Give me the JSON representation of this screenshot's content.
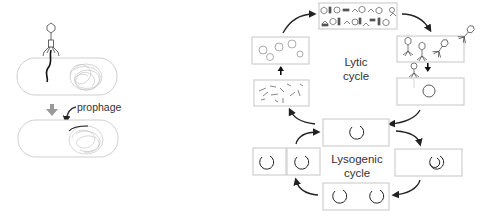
{
  "diagram": {
    "left_panel": {
      "label_prophage": "prophage"
    },
    "lytic": {
      "title_line1": "Lytic",
      "title_line2": "cycle"
    },
    "lysogenic": {
      "title_line1": "Lysogenic",
      "title_line2": "cycle"
    },
    "colors": {
      "line": "#222222",
      "cell_outline": "#cfcfcf",
      "dna": "#bdbdbd",
      "arrow": "#333333",
      "down_arrow_grey": "#9a9a9a"
    }
  }
}
